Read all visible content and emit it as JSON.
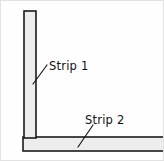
{
  "figure": {
    "background_color": "#fefefe",
    "border_color": "#e2e2e2",
    "stroke_color": "#1a1a1a",
    "fill_color": "#ededed"
  },
  "labels": {
    "strip_1": "Strip 1",
    "strip_2": "Strip 2"
  },
  "parts": {
    "vertical_strip": {
      "name": "Strip 1",
      "orientation": "vertical",
      "x": 23,
      "y": 10,
      "width": 12,
      "height": 127
    },
    "horizontal_strip": {
      "name": "Strip 2",
      "orientation": "horizontal",
      "x": 22,
      "y": 136,
      "width": 141,
      "height": 14
    }
  },
  "leaders": {
    "strip_1": {
      "from_x": 46,
      "from_y": 64,
      "to_x": 32,
      "to_y": 83
    },
    "strip_2": {
      "from_x": 92,
      "from_y": 124,
      "to_x": 77,
      "to_y": 146
    }
  },
  "text_positions": {
    "strip_1": {
      "x": 48,
      "y": 69
    },
    "strip_2": {
      "x": 84,
      "y": 123
    }
  }
}
